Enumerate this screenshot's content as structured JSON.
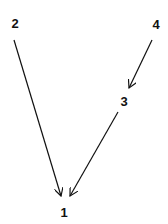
{
  "diagram": {
    "type": "directed-graph",
    "nodes": [
      {
        "id": "1",
        "label": "1",
        "x": 64,
        "y": 217
      },
      {
        "id": "2",
        "label": "2",
        "x": 15,
        "y": 28
      },
      {
        "id": "3",
        "label": "3",
        "x": 124,
        "y": 106
      },
      {
        "id": "4",
        "label": "4",
        "x": 156,
        "y": 29
      }
    ],
    "edges": [
      {
        "from": "2",
        "to": "1",
        "x1": 14,
        "y1": 40,
        "x2": 61,
        "y2": 196
      },
      {
        "from": "4",
        "to": "3",
        "x1": 152,
        "y1": 40,
        "x2": 129,
        "y2": 88
      },
      {
        "from": "3",
        "to": "1",
        "x1": 118,
        "y1": 112,
        "x2": 70,
        "y2": 196
      }
    ],
    "colors": {
      "line": "#111111",
      "background": "#ffffff"
    }
  }
}
